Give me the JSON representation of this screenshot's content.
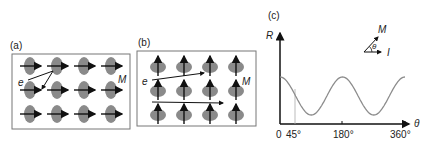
{
  "panels": {
    "a": {
      "label": "(a)",
      "electron_label": "e",
      "magnetization_label": "M",
      "spin_direction": "right",
      "grid": {
        "rows": 3,
        "cols": 4
      }
    },
    "b": {
      "label": "(b)",
      "electron_label": "e",
      "magnetization_label": "M",
      "spin_direction": "up",
      "grid": {
        "rows": 3,
        "cols": 4
      }
    },
    "c": {
      "label": "(c)",
      "inset": {
        "M_label": "M",
        "theta_label": "θ",
        "I_label": "I"
      }
    }
  },
  "chart_data": {
    "type": "line",
    "title": "(c)",
    "xlabel": "θ",
    "ylabel": "R",
    "x_ticks": [
      "0",
      "45°",
      "180°",
      "360°"
    ],
    "xlim": [
      0,
      360
    ],
    "grid": false,
    "series": [
      {
        "name": "R(θ) ∝ cos²θ",
        "x": [
          0,
          45,
          90,
          135,
          180,
          225,
          270,
          315,
          360
        ],
        "values": [
          1.0,
          0.5,
          0.0,
          0.5,
          1.0,
          0.5,
          0.0,
          0.5,
          1.0
        ]
      }
    ],
    "annotations": [
      "vertical guide line at 45°"
    ]
  },
  "colors": {
    "ellipse": "#8a8a8a",
    "arrow": "#111111",
    "curve": "#8c8c8c",
    "frame": "#777777"
  }
}
